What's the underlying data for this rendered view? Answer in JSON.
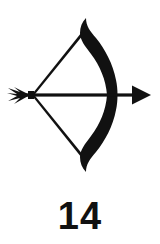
{
  "figure": {
    "caption": "14",
    "illustration_name": "bow-and-arrow",
    "colors": {
      "ink": "#111111",
      "background": "#ffffff"
    },
    "elements": {
      "bow_limb": "bow-limb",
      "bow_string": "bow-string",
      "arrow_shaft": "arrow-shaft",
      "arrow_head": "arrow-head",
      "arrow_fletching": "arrow-fletching"
    }
  }
}
